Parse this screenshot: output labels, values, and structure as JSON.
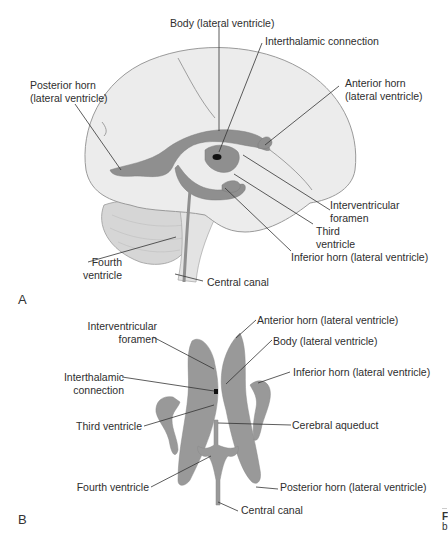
{
  "panel_a": {
    "letter": "A",
    "labels": {
      "body": "Body (lateral ventricle)",
      "interthalamic": "Interthalamic connection",
      "posterior_horn_1": "Posterior horn",
      "posterior_horn_2": "(lateral ventricle)",
      "anterior_horn_1": "Anterior horn",
      "anterior_horn_2": "(lateral ventricle)",
      "interventricular_1": "Interventricular",
      "interventricular_2": "foramen",
      "third_1": "Third",
      "third_2": "ventricle",
      "inferior_horn": "Inferior horn (lateral ventricle)",
      "fourth_1": "Fourth",
      "fourth_2": "ventricle",
      "central_canal": "Central canal"
    }
  },
  "panel_b": {
    "letter": "B",
    "labels": {
      "anterior_horn": "Anterior horn (lateral ventricle)",
      "interventricular_1": "Interventricular",
      "interventricular_2": "foramen",
      "body": "Body (lateral ventricle)",
      "inferior_horn": "Inferior horn (lateral ventricle)",
      "interthalamic_1": "Interthalamic",
      "interthalamic_2": "connection",
      "third": "Third ventricle",
      "cerebral_aqueduct": "Cerebral aqueduct",
      "posterior_horn": "Posterior horn (lateral ventricle)",
      "fourth": "Fourth ventricle",
      "central_canal": "Central canal"
    }
  },
  "edge_fragment": {
    "line1": "F",
    "line2": "b"
  },
  "colors": {
    "brain": "#e9e9e9",
    "brain_outline": "#9a9a9a",
    "ventricle": "#8f8f8f",
    "leader": "#333333"
  }
}
